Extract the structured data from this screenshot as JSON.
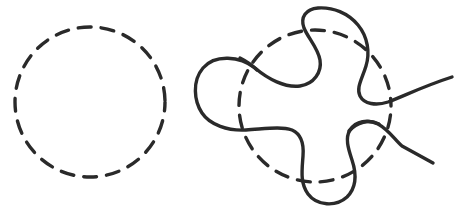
{
  "figure": {
    "background_color": "#ffffff",
    "stroke_color": "#2a2a2a",
    "width": 462,
    "height": 217,
    "panels": [
      {
        "name": "left-panel",
        "label": "Dashed circle",
        "shapes": [
          {
            "name": "dashed-circle-left",
            "type": "circle",
            "cx": 90,
            "cy": 102,
            "r": 75,
            "stroke_width": 3.4,
            "dash_pattern": "13 10",
            "dash_offset": 4,
            "color": "#2a2a2a"
          }
        ]
      },
      {
        "name": "right-panel",
        "label": "Deformed curve over dashed circle",
        "shapes": [
          {
            "name": "dashed-circle-right",
            "type": "circle",
            "cx": 315,
            "cy": 106,
            "r": 76,
            "stroke_width": 3.4,
            "dash_pattern": "13 10",
            "dash_offset": 60,
            "color": "#2a2a2a"
          },
          {
            "name": "deformed-curve-main",
            "type": "path",
            "stroke_width": 3.4,
            "color": "#2a2a2a",
            "description": "Four-lobed closed curve with crossings weaving over and under the dashed circle"
          },
          {
            "name": "tail-upper-right",
            "type": "path",
            "stroke_width": 3.4,
            "color": "#2a2a2a",
            "endpoint": [
              452,
              77
            ],
            "description": "Upper tail extending to the right edge"
          },
          {
            "name": "tail-lower-right",
            "type": "path",
            "stroke_width": 3.4,
            "color": "#2a2a2a",
            "endpoint": [
              433,
              144
            ],
            "description": "Lower tail extending down-right"
          }
        ]
      }
    ]
  }
}
